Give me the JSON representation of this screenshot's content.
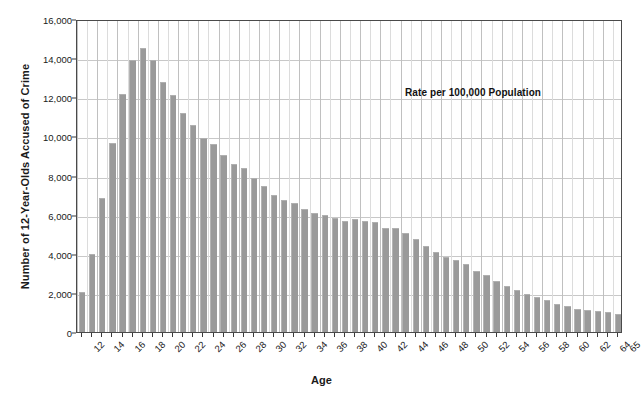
{
  "chart_data": {
    "type": "bar",
    "title": "",
    "xlabel": "Age",
    "ylabel": "Number of 12-Year-Olds Accused of Crime",
    "annotation": "Rate per 100,000 Population",
    "ylim": [
      0,
      16000
    ],
    "yticks": [
      0,
      2000,
      4000,
      6000,
      8000,
      10000,
      12000,
      14000,
      16000
    ],
    "ytick_labels": [
      "0",
      "2,000",
      "4,000",
      "6,000",
      "8,000",
      "10,000",
      "12,000",
      "14,000",
      "16,000"
    ],
    "grid": true,
    "legend": "none",
    "bar_color": "#9a9a9a",
    "xtick_step": 2,
    "categories": [
      12,
      13,
      14,
      15,
      16,
      17,
      18,
      19,
      20,
      21,
      22,
      23,
      24,
      25,
      26,
      27,
      28,
      29,
      30,
      31,
      32,
      33,
      34,
      35,
      36,
      37,
      38,
      39,
      40,
      41,
      42,
      43,
      44,
      45,
      46,
      47,
      48,
      49,
      50,
      51,
      52,
      53,
      54,
      55,
      56,
      57,
      58,
      59,
      60,
      61,
      62,
      63,
      64,
      65
    ],
    "values": [
      2050,
      4000,
      6850,
      9650,
      12150,
      13900,
      14500,
      13900,
      12800,
      12100,
      11200,
      10600,
      9900,
      9600,
      9050,
      8600,
      8400,
      7850,
      7450,
      7000,
      6750,
      6600,
      6300,
      6100,
      6000,
      5850,
      5650,
      5800,
      5700,
      5600,
      5300,
      5300,
      5050,
      4750,
      4400,
      4100,
      3850,
      3700,
      3500,
      3100,
      2900,
      2600,
      2350,
      2150,
      1950,
      1800,
      1650,
      1450,
      1350,
      1200,
      1150,
      1050,
      1000,
      900
    ]
  }
}
